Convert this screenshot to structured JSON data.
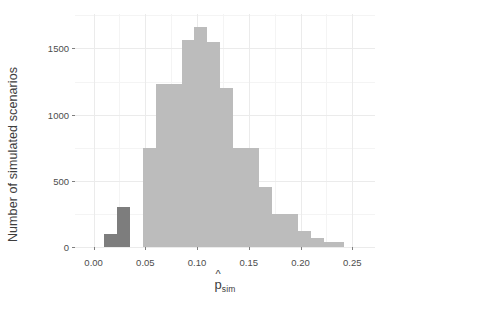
{
  "chart_data": {
    "type": "bar",
    "title": "",
    "subtitle": "",
    "xlabel": "p̂sim",
    "xlabel_base": "p",
    "xlabel_hat": "^",
    "xlabel_subscript": "sim",
    "ylabel": "Number of simulated scenarios",
    "xlim": [
      -0.018,
      0.272
    ],
    "ylim": [
      0,
      1760
    ],
    "grid": true,
    "legend": null,
    "bin_width": 0.0125,
    "x_ticks": [
      0.0,
      0.05,
      0.1,
      0.15,
      0.2,
      0.25
    ],
    "x_tick_labels": [
      "0.00",
      "0.05",
      "0.10",
      "0.15",
      "0.20",
      "0.25"
    ],
    "y_ticks": [
      0,
      500,
      1000,
      1500
    ],
    "y_tick_labels": [
      "0",
      "500",
      "1000",
      "1500"
    ],
    "y_minor_ticks": [
      250,
      750,
      1250,
      1750
    ],
    "x_minor_ticks": [
      0.025,
      0.075,
      0.125,
      0.175,
      0.225
    ],
    "colors": {
      "bar_light": "#bcbcbc",
      "bar_dark": "#7d7d7d",
      "panel_background": "#ffffff",
      "grid_major": "#ebebeb",
      "grid_minor": "#f4f4f4",
      "text": "#4d4d4d",
      "axis_tick": "#7f7f7f"
    },
    "bins": [
      {
        "x0": 0.01,
        "x1": 0.0225,
        "value": 100,
        "shade": "dark"
      },
      {
        "x0": 0.0225,
        "x1": 0.035,
        "value": 300,
        "shade": "dark"
      },
      {
        "x0": 0.035,
        "x1": 0.0475,
        "value": 0,
        "shade": "light"
      },
      {
        "x0": 0.0475,
        "x1": 0.06,
        "value": 750,
        "shade": "light"
      },
      {
        "x0": 0.06,
        "x1": 0.0725,
        "value": 1230,
        "shade": "light"
      },
      {
        "x0": 0.0725,
        "x1": 0.085,
        "value": 1230,
        "shade": "light"
      },
      {
        "x0": 0.085,
        "x1": 0.0975,
        "value": 1560,
        "shade": "light"
      },
      {
        "x0": 0.0975,
        "x1": 0.11,
        "value": 1660,
        "shade": "light"
      },
      {
        "x0": 0.11,
        "x1": 0.1225,
        "value": 1550,
        "shade": "light"
      },
      {
        "x0": 0.1225,
        "x1": 0.135,
        "value": 1200,
        "shade": "light"
      },
      {
        "x0": 0.135,
        "x1": 0.1475,
        "value": 750,
        "shade": "light"
      },
      {
        "x0": 0.1475,
        "x1": 0.16,
        "value": 750,
        "shade": "light"
      },
      {
        "x0": 0.16,
        "x1": 0.1725,
        "value": 450,
        "shade": "light"
      },
      {
        "x0": 0.1725,
        "x1": 0.185,
        "value": 250,
        "shade": "light"
      },
      {
        "x0": 0.185,
        "x1": 0.1975,
        "value": 250,
        "shade": "light"
      },
      {
        "x0": 0.1975,
        "x1": 0.21,
        "value": 120,
        "shade": "light"
      },
      {
        "x0": 0.21,
        "x1": 0.2225,
        "value": 65,
        "shade": "light"
      },
      {
        "x0": 0.2225,
        "x1": 0.235,
        "value": 35,
        "shade": "light"
      },
      {
        "x0": 0.235,
        "x1": 0.2425,
        "value": 35,
        "shade": "light"
      }
    ]
  }
}
